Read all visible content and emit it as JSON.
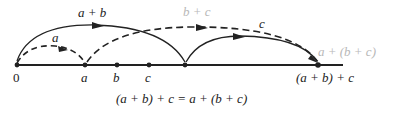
{
  "diagram": {
    "caption": "(a + b) + c = a + (b + c)",
    "points": [
      {
        "id": "zero",
        "label": "0",
        "x": 17
      },
      {
        "id": "a",
        "label": "a",
        "x": 85
      },
      {
        "id": "b",
        "label": "b",
        "x": 117
      },
      {
        "id": "c",
        "label": "c",
        "x": 149
      },
      {
        "id": "a_plus_b",
        "label": "",
        "x": 185
      },
      {
        "id": "end",
        "label": "(a + b) + c",
        "x": 318
      }
    ],
    "arcs": [
      {
        "id": "arc-a",
        "label": "a",
        "style": "dashed",
        "from": "0",
        "to": "a"
      },
      {
        "id": "arc-a-plus-b",
        "label": "a + b",
        "style": "solid",
        "from": "0",
        "to": "a + b"
      },
      {
        "id": "arc-b-plus-c",
        "label": "b + c",
        "style": "dashed",
        "from": "a",
        "to": "(a + b) + c"
      },
      {
        "id": "arc-c",
        "label": "c",
        "style": "solid",
        "from": "a + b",
        "to": "(a + b) + c"
      }
    ],
    "right_label": "a + (b + c)",
    "colors": {
      "ink": "#222222",
      "faded": "#b8b8b8",
      "background": "#ffffff"
    }
  }
}
